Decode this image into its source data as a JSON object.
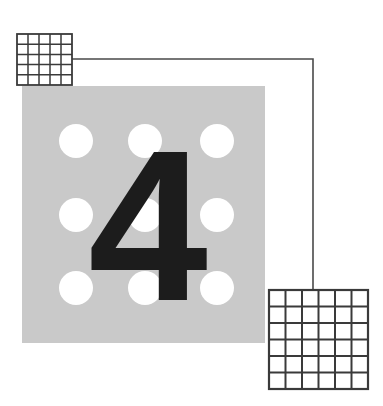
{
  "figure": {
    "background_color": "#ffffff",
    "canvas": {
      "width": 383,
      "height": 406
    },
    "plate": {
      "name": "gray-plate",
      "fill_color": "#c9c9c9",
      "x": 22,
      "y": 86,
      "width": 243,
      "height": 257
    },
    "holes": {
      "name": "hole-array",
      "fill_color": "#ffffff",
      "rows": 3,
      "columns": 9,
      "radius": 17,
      "centers_x": [
        76,
        145,
        217
      ],
      "centers_y": [
        141,
        215,
        288
      ]
    },
    "digit": {
      "label": "4",
      "color": "#1c1c1c",
      "font_size": 215,
      "center_x": 148,
      "baseline_y": 300
    },
    "connector": {
      "name": "leader-line",
      "color": "#4a4a4a",
      "stroke_width": 1.6,
      "path": "M 70 59 L 313 59 L 313 291",
      "from": "grid-top-left",
      "to": "grid-bottom-right"
    },
    "grid_top_left": {
      "label": "grid-top-left",
      "x": 17,
      "y": 34,
      "width": 55,
      "height": 51,
      "columns": 5,
      "rows": 5,
      "cell_fill": "#ffffff",
      "line_color": "#3a3a3a",
      "line_width": 1.5,
      "border_width": 1.8
    },
    "grid_bottom_right": {
      "label": "grid-bottom-right",
      "x": 269,
      "y": 290,
      "width": 99,
      "height": 99,
      "columns": 6,
      "rows": 6,
      "cell_fill": "#ffffff",
      "line_color": "#3a3a3a",
      "line_width": 2.0,
      "border_width": 2.2
    }
  }
}
